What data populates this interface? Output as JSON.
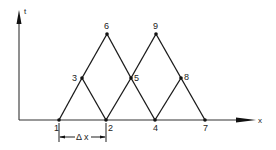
{
  "diagram": {
    "axes": {
      "vertical_label": "t",
      "horizontal_label": "x"
    },
    "nodes": [
      {
        "id": "1",
        "label": "1",
        "x": 59,
        "y": 120
      },
      {
        "id": "2",
        "label": "2",
        "x": 106,
        "y": 120
      },
      {
        "id": "3",
        "label": "3",
        "x": 82,
        "y": 78
      },
      {
        "id": "4",
        "label": "4",
        "x": 155,
        "y": 120
      },
      {
        "id": "5",
        "label": "5",
        "x": 131,
        "y": 78
      },
      {
        "id": "6",
        "label": "6",
        "x": 107,
        "y": 34
      },
      {
        "id": "7",
        "label": "7",
        "x": 205,
        "y": 120
      },
      {
        "id": "8",
        "label": "8",
        "x": 181,
        "y": 78
      },
      {
        "id": "9",
        "label": "9",
        "x": 156,
        "y": 34
      }
    ],
    "edges": [
      [
        "1",
        "3"
      ],
      [
        "3",
        "6"
      ],
      [
        "6",
        "5"
      ],
      [
        "5",
        "4"
      ],
      [
        "3",
        "2"
      ],
      [
        "2",
        "5"
      ],
      [
        "5",
        "9"
      ],
      [
        "9",
        "8"
      ],
      [
        "8",
        "7"
      ],
      [
        "4",
        "8"
      ]
    ],
    "dimension": {
      "label": "Δ x",
      "from_node": "1",
      "to_node": "2"
    }
  }
}
